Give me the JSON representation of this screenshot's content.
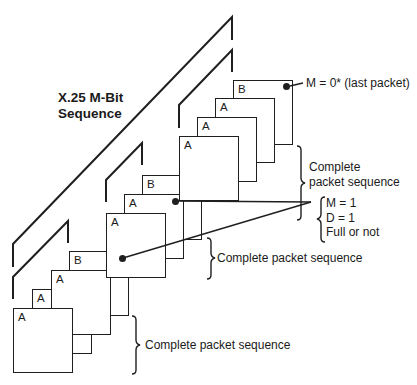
{
  "title": {
    "line1": "X.25 M-Bit",
    "line2": "Sequence"
  },
  "groups": [
    {
      "name": "bottom",
      "packets": [
        {
          "label": "A",
          "x": 13,
          "y": 308,
          "w": 60,
          "h": 65
        },
        {
          "label": "A",
          "x": 32,
          "y": 289,
          "w": 60,
          "h": 65
        },
        {
          "label": "A",
          "x": 51,
          "y": 270,
          "w": 60,
          "h": 65
        },
        {
          "label": "B",
          "x": 69,
          "y": 251,
          "w": 60,
          "h": 65
        }
      ],
      "brace_label": "Complete packet sequence"
    },
    {
      "name": "middle",
      "packets": [
        {
          "label": "A",
          "x": 106,
          "y": 213,
          "w": 60,
          "h": 65
        },
        {
          "label": "A",
          "x": 124,
          "y": 194,
          "w": 60,
          "h": 65
        },
        {
          "label": "B",
          "x": 142,
          "y": 175,
          "w": 60,
          "h": 65
        }
      ],
      "brace_label": "Complete packet sequence"
    },
    {
      "name": "top",
      "packets": [
        {
          "label": "A",
          "x": 179,
          "y": 136,
          "w": 60,
          "h": 65
        },
        {
          "label": "A",
          "x": 197,
          "y": 117,
          "w": 60,
          "h": 65
        },
        {
          "label": "A",
          "x": 215,
          "y": 98,
          "w": 60,
          "h": 65
        },
        {
          "label": "B",
          "x": 233,
          "y": 80,
          "w": 60,
          "h": 65
        }
      ],
      "brace_label_line1": "Complete",
      "brace_label_line2": "packet sequence"
    }
  ],
  "annotations": {
    "last_packet": "M = 0* (last packet)",
    "m_bit": "M = 1",
    "d_bit": "D = 1",
    "full": "Full or not"
  },
  "colors": {
    "line": "#1f1f1f",
    "background": "#ffffff"
  }
}
